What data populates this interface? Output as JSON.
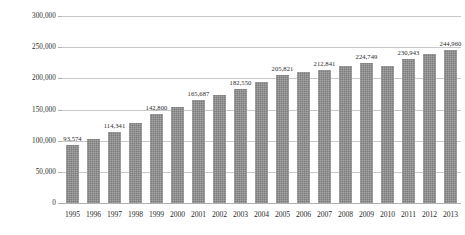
{
  "chart_data": {
    "type": "bar",
    "title": "",
    "subtitle": "",
    "xlabel": "",
    "ylabel": "",
    "ylim": [
      0,
      300000
    ],
    "y_ticks": [
      0,
      50000,
      100000,
      150000,
      200000,
      250000,
      300000
    ],
    "y_tick_labels": [
      "0",
      "50,000",
      "100,000",
      "150,000",
      "200,000",
      "250,000",
      "300,000"
    ],
    "grid": true,
    "legend": "none",
    "bar_color": "#8a8a8a",
    "categories": [
      "1995",
      "1996",
      "1997",
      "1998",
      "1999",
      "2000",
      "2001",
      "2002",
      "2003",
      "2004",
      "2005",
      "2006",
      "2007",
      "2008",
      "2009",
      "2010",
      "2011",
      "2012",
      "2013"
    ],
    "values": [
      93574,
      103500,
      114341,
      128200,
      142800,
      154500,
      165687,
      172500,
      182550,
      194000,
      205821,
      209500,
      212841,
      219800,
      224749,
      219200,
      230943,
      239200,
      244960
    ],
    "data_labels": [
      {
        "category": "1995",
        "value": 93574,
        "label": "93,574",
        "shown": true
      },
      {
        "category": "1996",
        "value": 103500,
        "label": "",
        "shown": false
      },
      {
        "category": "1997",
        "value": 114341,
        "label": "114,341",
        "shown": true
      },
      {
        "category": "1998",
        "value": 128200,
        "label": "",
        "shown": false
      },
      {
        "category": "1999",
        "value": 142800,
        "label": "142,800",
        "shown": true
      },
      {
        "category": "2000",
        "value": 154500,
        "label": "",
        "shown": false
      },
      {
        "category": "2001",
        "value": 165687,
        "label": "165,687",
        "shown": true
      },
      {
        "category": "2002",
        "value": 172500,
        "label": "",
        "shown": false
      },
      {
        "category": "2003",
        "value": 182550,
        "label": "182,550",
        "shown": true
      },
      {
        "category": "2004",
        "value": 194000,
        "label": "",
        "shown": false
      },
      {
        "category": "2005",
        "value": 205821,
        "label": "205,821",
        "shown": true
      },
      {
        "category": "2006",
        "value": 209500,
        "label": "",
        "shown": false
      },
      {
        "category": "2007",
        "value": 212841,
        "label": "212,841",
        "shown": true
      },
      {
        "category": "2008",
        "value": 219800,
        "label": "",
        "shown": false
      },
      {
        "category": "2009",
        "value": 224749,
        "label": "224,749",
        "shown": true
      },
      {
        "category": "2010",
        "value": 219200,
        "label": "",
        "shown": false
      },
      {
        "category": "2011",
        "value": 230943,
        "label": "230,943",
        "shown": true
      },
      {
        "category": "2012",
        "value": 239200,
        "label": "",
        "shown": false
      },
      {
        "category": "2013",
        "value": 244960,
        "label": "244,960",
        "shown": true
      }
    ]
  }
}
